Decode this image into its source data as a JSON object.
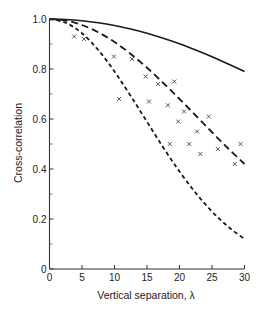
{
  "chart_data": {
    "type": "line",
    "title": "",
    "xlabel": "Vertical separation, λ",
    "ylabel": "Cross-correlation",
    "xlim": [
      0,
      30
    ],
    "ylim": [
      0,
      1.0
    ],
    "grid": false,
    "legend": null,
    "x_ticks": [
      0,
      5,
      10,
      15,
      20,
      25,
      30
    ],
    "x_tick_labels": [
      "0",
      "5",
      "10",
      "15",
      "20",
      "25",
      "30"
    ],
    "y_ticks": [
      0,
      0.2,
      0.4,
      0.6,
      0.8,
      1.0
    ],
    "y_tick_labels": [
      "0",
      "0.2",
      "0.4",
      "0.6",
      "0.8",
      "1.0"
    ],
    "y_minor_ticks": [
      0.1,
      0.3,
      0.5,
      0.7,
      0.9
    ],
    "series": [
      {
        "name": "solid curve",
        "style": "solid",
        "x": [
          0,
          2.5,
          5,
          7.5,
          10,
          12.5,
          15,
          17.5,
          20,
          22.5,
          25,
          27.5,
          30
        ],
        "values": [
          1.0,
          0.998,
          0.993,
          0.985,
          0.974,
          0.96,
          0.943,
          0.923,
          0.901,
          0.876,
          0.849,
          0.82,
          0.79
        ]
      },
      {
        "name": "long-dash curve",
        "style": "long-dash",
        "x": [
          0,
          2.5,
          5,
          7.5,
          10,
          12.5,
          15,
          17.5,
          20,
          22.5,
          25,
          27.5,
          30
        ],
        "values": [
          1.0,
          0.994,
          0.976,
          0.947,
          0.908,
          0.86,
          0.805,
          0.744,
          0.68,
          0.614,
          0.547,
          0.482,
          0.42
        ]
      },
      {
        "name": "short-dash curve",
        "style": "short-dash",
        "x": [
          0,
          2.5,
          5,
          7.5,
          10,
          12.5,
          15,
          17.5,
          20,
          22.5,
          25,
          27.5,
          30
        ],
        "values": [
          1.0,
          0.985,
          0.943,
          0.876,
          0.79,
          0.692,
          0.589,
          0.486,
          0.39,
          0.304,
          0.23,
          0.169,
          0.12
        ]
      },
      {
        "name": "observations",
        "style": "marker-x",
        "x": [
          3.8,
          5.3,
          9.9,
          12.7,
          14.8,
          16.7,
          19.2,
          10.7,
          15.3,
          18.2,
          20.7,
          24.5,
          19.8,
          22.7,
          18.5,
          21.5,
          25.9,
          29.4,
          23.2,
          28.5
        ],
        "values": [
          0.93,
          0.92,
          0.85,
          0.84,
          0.77,
          0.74,
          0.75,
          0.68,
          0.67,
          0.655,
          0.63,
          0.61,
          0.59,
          0.55,
          0.5,
          0.5,
          0.48,
          0.5,
          0.46,
          0.42
        ]
      }
    ]
  }
}
